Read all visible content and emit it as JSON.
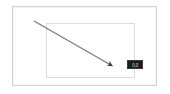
{
  "canvas": {
    "width": 170,
    "height": 94,
    "background_color": "#ffffff"
  },
  "outer_frame": {
    "name": "outer window frame",
    "border_color": "#d2d2d2",
    "fill_color": "#ffffff"
  },
  "inner_rect": {
    "name": "inner content rectangle",
    "border_color": "#dcdcdc",
    "fill_color": "#ffffff"
  },
  "arrow": {
    "label": "drag arrow",
    "color": "#7a7a7a",
    "head_color": "#3d3d3d",
    "start_x": 34,
    "start_y": 21,
    "end_x": 116,
    "end_y": 68,
    "stroke_width": 1.3
  },
  "tooltip": {
    "text": "0,0",
    "background_color": "#1b1b1b",
    "text_color": "#cfcfcf",
    "border_color": "#3a3a3a"
  }
}
